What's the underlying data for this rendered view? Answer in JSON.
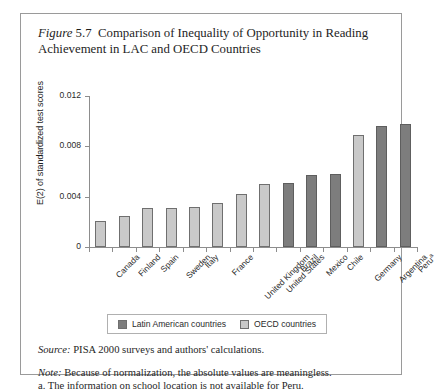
{
  "figure": {
    "label": "Figure",
    "number": "5.7",
    "title": "Comparison of Inequality of Opportunity in Reading Achievement in LAC and OECD Countries"
  },
  "legend": {
    "entries": [
      {
        "label": "Latin American countries",
        "group": "lac",
        "color": "#7d7d7d"
      },
      {
        "label": "OECD countries",
        "group": "oecd",
        "color": "#c9c9c9"
      }
    ]
  },
  "footnotes": {
    "source_lead": "Source:",
    "source_text": "PISA 2000 surveys and authors' calculations.",
    "note_lead": "Note:",
    "note_text": "Because of normalization, the absolute values are meaningless.",
    "note_a": "a. The information on school location is not available for Peru."
  },
  "chart_data": {
    "type": "bar",
    "title": "Comparison of Inequality of Opportunity in Reading Achievement in LAC and OECD Countries",
    "xlabel": "",
    "ylabel": "E(2) of standardized test scores",
    "ylim": [
      0,
      0.012
    ],
    "yticks": [
      0,
      0.004,
      0.008,
      0.012
    ],
    "ytick_labels": [
      "0",
      "0.004",
      "0.008",
      "0.012"
    ],
    "grid": false,
    "legend_position": "bottom",
    "categories": [
      "Canada",
      "Finland",
      "Spain",
      "Sweden",
      "Italy",
      "France",
      "United Kingdom",
      "United States",
      "Brazil",
      "Mexico",
      "Chile",
      "Germany",
      "Argentina",
      "Peru"
    ],
    "category_footnote_markers": {
      "Peru": "a"
    },
    "values": [
      0.0021,
      0.0025,
      0.0031,
      0.0031,
      0.0032,
      0.0035,
      0.0042,
      0.005,
      0.0051,
      0.0057,
      0.0058,
      0.0089,
      0.0096,
      0.0098
    ],
    "groups": [
      "oecd",
      "oecd",
      "oecd",
      "oecd",
      "oecd",
      "oecd",
      "oecd",
      "oecd",
      "lac",
      "lac",
      "lac",
      "oecd",
      "lac",
      "lac"
    ],
    "group_colors": {
      "oecd": "#c9c9c9",
      "lac": "#7d7d7d"
    }
  }
}
